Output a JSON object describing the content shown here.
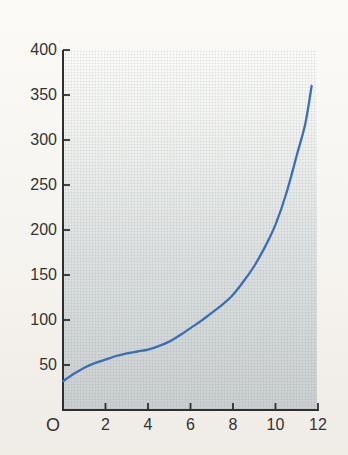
{
  "chart_data": {
    "type": "line",
    "title": "",
    "xlabel": "",
    "ylabel": "",
    "xlim": [
      0,
      12
    ],
    "ylim": [
      0,
      400
    ],
    "x_ticks": [
      2,
      4,
      6,
      8,
      10,
      12
    ],
    "y_ticks": [
      50,
      100,
      150,
      200,
      250,
      300,
      350,
      400
    ],
    "origin_label": "O",
    "grid": false,
    "legend": "none",
    "series": [
      {
        "name": "growth-curve",
        "color": "#3b6fb3",
        "points": [
          [
            0,
            32
          ],
          [
            0.5,
            40
          ],
          [
            1,
            47
          ],
          [
            1.5,
            52
          ],
          [
            2,
            56
          ],
          [
            2.5,
            60
          ],
          [
            3,
            63
          ],
          [
            3.5,
            65
          ],
          [
            4,
            67
          ],
          [
            4.5,
            71
          ],
          [
            5,
            76
          ],
          [
            5.5,
            83
          ],
          [
            6,
            91
          ],
          [
            6.5,
            99
          ],
          [
            7,
            108
          ],
          [
            7.5,
            117
          ],
          [
            8,
            128
          ],
          [
            8.5,
            143
          ],
          [
            9,
            160
          ],
          [
            9.5,
            181
          ],
          [
            10,
            206
          ],
          [
            10.5,
            240
          ],
          [
            11,
            283
          ],
          [
            11.4,
            318
          ],
          [
            11.7,
            360
          ]
        ]
      }
    ],
    "colors": {
      "axis": "#2f2f2f",
      "labels": "#333333",
      "plot_gradient_top": "#fbfbf9",
      "plot_gradient_bottom": "#cbcfd0"
    }
  }
}
